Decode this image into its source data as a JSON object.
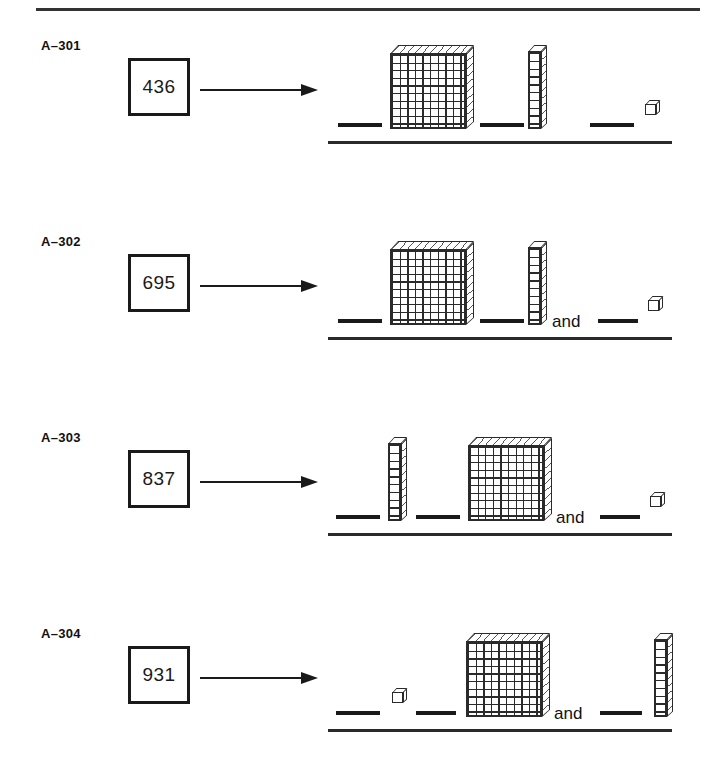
{
  "page": {
    "title": "Base-Ten Blocks Place Value Worksheet",
    "ink_color": "#1a1a1a",
    "background_color": "#ffffff",
    "has_top_rule": true
  },
  "glyphs": {
    "flat_label": "hundreds-flat",
    "rod_label": "tens-rod",
    "cube_label": "ones-cube",
    "blank_label": "answer-blank",
    "arrow_label": "right-arrow"
  },
  "problems": [
    {
      "id": "A–301",
      "number": "436",
      "and_word": "",
      "slots": [
        {
          "kind": "blank",
          "left": 10,
          "width": 44
        },
        {
          "kind": "flat",
          "left": 62
        },
        {
          "kind": "blank",
          "left": 152,
          "width": 44
        },
        {
          "kind": "rod",
          "left": 200
        },
        {
          "kind": "blank",
          "left": 262,
          "width": 44
        },
        {
          "kind": "cube",
          "left": 317
        }
      ]
    },
    {
      "id": "A–302",
      "number": "695",
      "and_word": "and",
      "slots": [
        {
          "kind": "blank",
          "left": 10,
          "width": 44
        },
        {
          "kind": "flat",
          "left": 62
        },
        {
          "kind": "blank",
          "left": 152,
          "width": 44
        },
        {
          "kind": "rod",
          "left": 200
        },
        {
          "kind": "and",
          "left": 224
        },
        {
          "kind": "blank",
          "left": 270,
          "width": 40
        },
        {
          "kind": "cube",
          "left": 320
        }
      ]
    },
    {
      "id": "A–303",
      "number": "837",
      "and_word": "and",
      "slots": [
        {
          "kind": "blank",
          "left": 8,
          "width": 44
        },
        {
          "kind": "rod",
          "left": 60
        },
        {
          "kind": "blank",
          "left": 88,
          "width": 44
        },
        {
          "kind": "flat",
          "left": 140
        },
        {
          "kind": "and",
          "left": 228
        },
        {
          "kind": "blank",
          "left": 272,
          "width": 40
        },
        {
          "kind": "cube",
          "left": 322
        }
      ]
    },
    {
      "id": "A–304",
      "number": "931",
      "and_word": "and",
      "slots": [
        {
          "kind": "blank",
          "left": 8,
          "width": 44
        },
        {
          "kind": "cube",
          "left": 64
        },
        {
          "kind": "blank",
          "left": 88,
          "width": 40
        },
        {
          "kind": "flat",
          "left": 138
        },
        {
          "kind": "and",
          "left": 226
        },
        {
          "kind": "blank",
          "left": 272,
          "width": 42
        },
        {
          "kind": "rod",
          "left": 326
        }
      ]
    }
  ]
}
